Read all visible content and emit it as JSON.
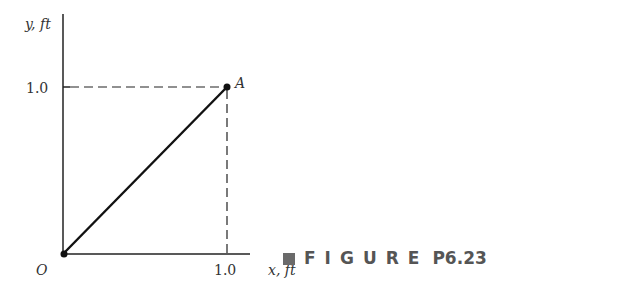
{
  "figure": {
    "caption_word": "FIGURE",
    "caption_number": "P6.23"
  },
  "axes": {
    "y_label": "y, ft",
    "x_label": "x, ft",
    "origin_label": "O",
    "x_tick": "1.0",
    "y_tick": "1.0"
  },
  "points": [
    {
      "label": "A",
      "x": 1.0,
      "y": 1.0
    },
    {
      "label": "O",
      "x": 0.0,
      "y": 0.0
    }
  ],
  "colors": {
    "line": "#111111",
    "caption": "#555555"
  }
}
